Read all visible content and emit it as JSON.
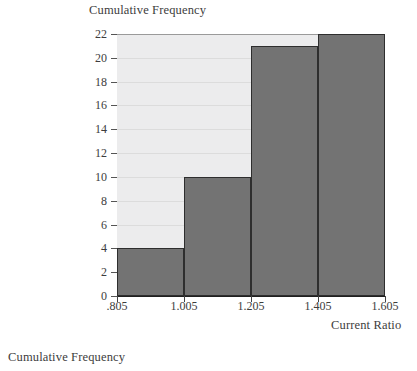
{
  "figure": {
    "caption": "Cumulative Frequency",
    "background_color": "#ffffff",
    "plot_background_color": "#ececed",
    "bar_color": "#737373",
    "bar_border_color": "#2e2e2e",
    "grid_color": "#dcdcdc",
    "axis_color": "#1f1f1f"
  },
  "chart_data": {
    "type": "bar",
    "title": "",
    "ylabel": "Cumulative Frequency",
    "xlabel": "Current Ratio",
    "categories": [
      "0.805-1.005",
      "1.005-1.205",
      "1.205-1.405",
      "1.405-1.605"
    ],
    "bin_edges": [
      0.805,
      1.005,
      1.205,
      1.405,
      1.605
    ],
    "values": [
      4,
      10,
      21,
      22
    ],
    "ylim": [
      0,
      22
    ],
    "xlim": [
      0.805,
      1.605
    ],
    "yticks": [
      0,
      2,
      4,
      6,
      8,
      10,
      12,
      14,
      16,
      18,
      20,
      22
    ],
    "ytick_labels": [
      "0",
      "2",
      "4",
      "6",
      "8",
      "10",
      "12",
      "14",
      "16",
      "18",
      "20",
      "22"
    ],
    "xticks": [
      0.805,
      1.005,
      1.205,
      1.405,
      1.605
    ],
    "xtick_labels": [
      ".805",
      "1.005",
      "1.205",
      "1.405",
      "1.605"
    ],
    "grid": "horizontal",
    "legend": null
  }
}
